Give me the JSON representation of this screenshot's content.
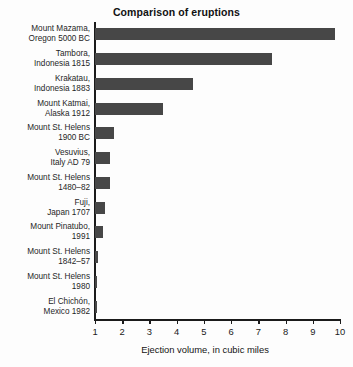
{
  "chart_data": {
    "type": "bar",
    "orientation": "horizontal",
    "title": "Comparison of eruptions",
    "xlabel": "Ejection volume, in cubic miles",
    "ylabel": "",
    "xlim": [
      1,
      10
    ],
    "xticks": [
      1,
      2,
      3,
      4,
      5,
      6,
      7,
      8,
      9,
      10
    ],
    "xticklabels": [
      "1",
      "2",
      "3",
      "4",
      "5",
      "6",
      "7",
      "8",
      "9",
      "10"
    ],
    "grid": false,
    "legend": false,
    "bar_color": "#474747",
    "axis_color": "#1b1b1b",
    "categories": [
      "Mount Mazama, Oregon 5000 BC",
      "Tambora, Indonesia 1815",
      "Krakatau, Indonesia 1883",
      "Mount Katmai, Alaska 1912",
      "Mount St. Helens 1900 BC",
      "Vesuvius, Italy AD 79",
      "Mount St. Helens 1480–82",
      "Fuji, Japan 1707",
      "Mount Pinatubo, 1991",
      "Mount St. Helens 1842–57",
      "Mount St. Helens 1980",
      "El Chichón, Mexico 1982"
    ],
    "category_lines": [
      [
        "Mount Mazama,",
        "Oregon 5000 BC"
      ],
      [
        "Tambora,",
        "Indonesia 1815"
      ],
      [
        "Krakatau,",
        "Indonesia 1883"
      ],
      [
        "Mount Katmai,",
        "Alaska 1912"
      ],
      [
        "Mount St. Helens",
        "1900 BC"
      ],
      [
        "Vesuvius,",
        "Italy AD 79"
      ],
      [
        "Mount St. Helens",
        "1480–82"
      ],
      [
        "Fuji,",
        "Japan 1707"
      ],
      [
        "Mount Pinatubo,",
        "1991"
      ],
      [
        "Mount St. Helens",
        "1842–57"
      ],
      [
        "Mount St. Helens",
        "1980"
      ],
      [
        "El Chichón,",
        "Mexico 1982"
      ]
    ],
    "values": [
      9.8,
      7.5,
      4.6,
      3.5,
      1.7,
      1.55,
      1.55,
      1.37,
      1.3,
      1.12,
      1.08,
      1.05
    ]
  }
}
